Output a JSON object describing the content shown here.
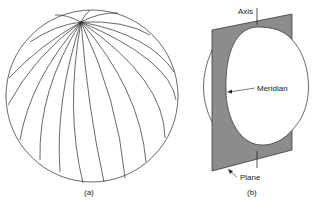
{
  "figure": {
    "panel_a": {
      "caption": "(a)",
      "description": "Sphere with meridian lines converging at the pole"
    },
    "panel_b": {
      "caption": "(b)",
      "labels": {
        "axis": "Axis",
        "meridian": "Meridian",
        "plane": "Plane"
      }
    }
  },
  "colors": {
    "line": "#2a2a2a",
    "plane_fill": "#8c8c8c",
    "background": "#ffffff"
  }
}
